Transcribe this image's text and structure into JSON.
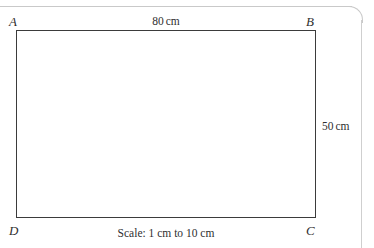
{
  "figure": {
    "type": "scale-drawing-rectangle",
    "shape": "rectangle",
    "vertices": {
      "top_left": "A",
      "top_right": "B",
      "bottom_right": "C",
      "bottom_left": "D"
    },
    "dimensions": {
      "top_label": "80 cm",
      "top_value": "80",
      "top_unit": "cm",
      "right_label": "50 cm",
      "right_value": "50",
      "right_unit": "cm"
    },
    "caption": "Scale: 1 cm to 10 cm",
    "stroke_color": "#3b3b3b",
    "fill_color": "#ffffff",
    "page_edge_color": "#c9c9c9"
  }
}
